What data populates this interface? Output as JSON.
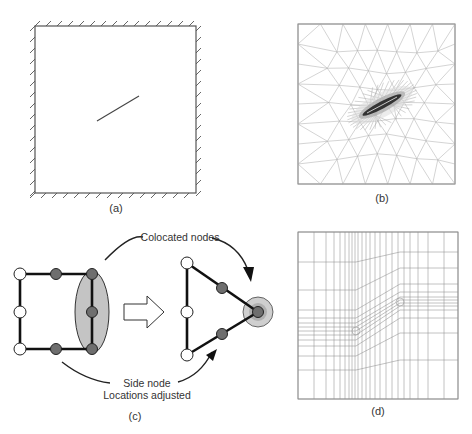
{
  "panels": {
    "a": {
      "caption": "(a)",
      "description": "Square domain with fixed (hatched) boundaries on all sides and an inclined crack in the interior"
    },
    "b": {
      "caption": "(b)",
      "description": "Unstructured triangular mesh refined around the crack"
    },
    "c": {
      "caption": "(c)",
      "description": "Collapsed quadratic element: right side nodes colocated into crack tip node",
      "annotations": {
        "colocated": "Colocated nodes",
        "side_node_line1": "Side node",
        "side_node_line2": "Locations adjusted"
      }
    },
    "d": {
      "caption": "(d)",
      "description": "Structured quadrilateral mesh with graded refinement toward two crack tips"
    }
  },
  "colors": {
    "line": "#555555",
    "mesh": "#9a9a9a",
    "node_fill_grey": "#6e6e6e",
    "node_fill_white": "#ffffff",
    "ellipse_fill": "#c4c4c4",
    "halo_fill": "#cfcfcf"
  }
}
